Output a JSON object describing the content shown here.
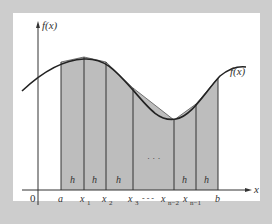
{
  "figure": {
    "y_axis_label": "f(x)",
    "curve_label": "f(x)",
    "x_axis_label": "x",
    "origin_label": "0",
    "strip_width_label": "h",
    "middle_ellipsis": "· · ·",
    "tick_labels": [
      {
        "main": "a",
        "sub": ""
      },
      {
        "main": "x",
        "sub": "1"
      },
      {
        "main": "x",
        "sub": "2"
      },
      {
        "main": "x",
        "sub": "3"
      },
      {
        "main": "x",
        "sub": "n−2"
      },
      {
        "main": "x",
        "sub": "n−1"
      },
      {
        "main": "b",
        "sub": ""
      }
    ],
    "dots_between": "- - -",
    "colors": {
      "background": "#cdcdcd",
      "panel": "#ffffff",
      "fill": "#bdbdbd",
      "line": "#333333"
    }
  }
}
